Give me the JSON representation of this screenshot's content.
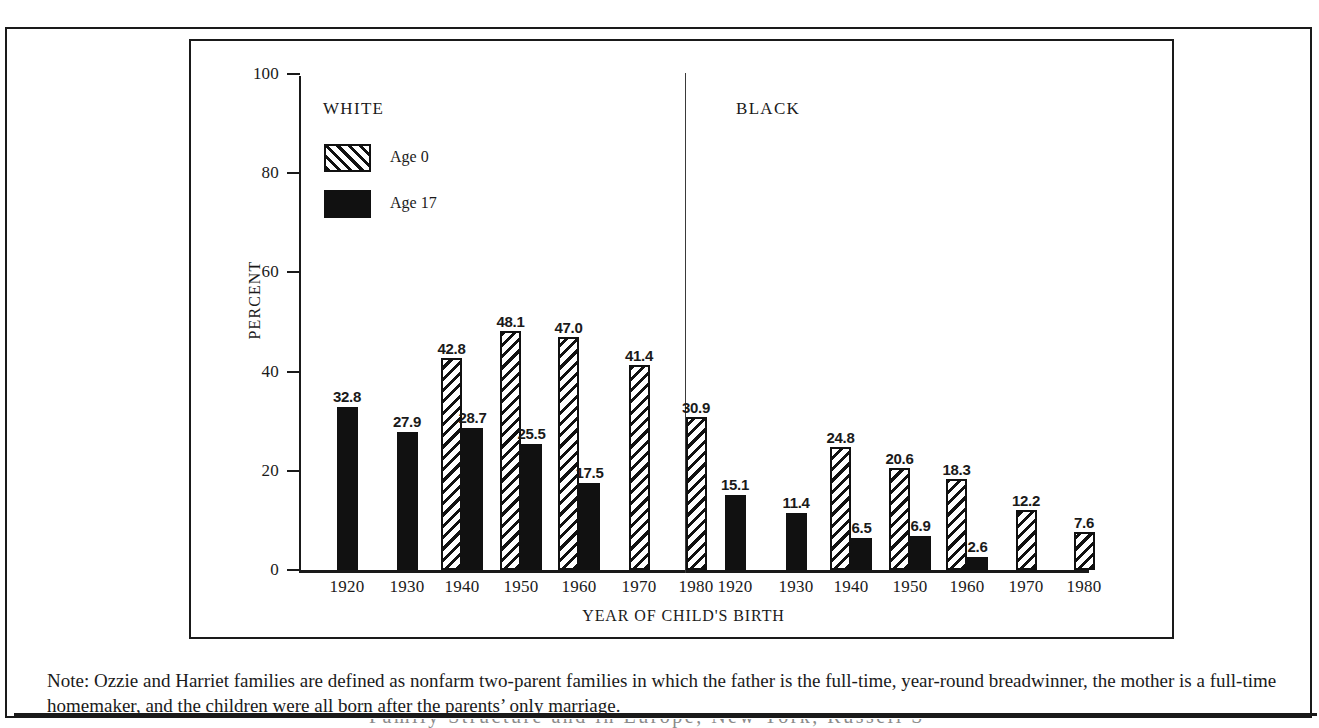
{
  "figure": {
    "y_axis_title": "PERCENT",
    "x_axis_title": "YEAR OF CHILD'S BIRTH",
    "group_white": "WHITE",
    "group_black": "BLACK",
    "legend": [
      {
        "label": "Age 0",
        "swatch": "hatched-swatch"
      },
      {
        "label": "Age 17",
        "swatch": "solid-swatch"
      }
    ],
    "y_ticks": [
      "0",
      "20",
      "40",
      "60",
      "80",
      "100"
    ]
  },
  "note": {
    "text": "Note: Ozzie and Harriet families are defined as nonfarm two-parent families in which the father is the full-time, year-round breadwinner, the mother is a full-time homemaker, and the children were all born after the parents’ only marriage."
  },
  "footer": {
    "clipped_text": "Family Structure and in Europe, New York, Russell S"
  },
  "chart_data": {
    "type": "bar",
    "title": "",
    "xlabel": "YEAR OF CHILD'S BIRTH",
    "ylabel": "PERCENT",
    "ylim": [
      0,
      100
    ],
    "ytick_step": 20,
    "grid": false,
    "legend_position": "inside-top-left",
    "panels": [
      {
        "name": "WHITE",
        "categories": [
          "1920",
          "1930",
          "1940",
          "1950",
          "1960",
          "1970",
          "1980"
        ],
        "series": [
          {
            "name": "Age 0",
            "values": [
              null,
              null,
              42.8,
              48.1,
              47.0,
              41.4,
              30.9
            ]
          },
          {
            "name": "Age 17",
            "values": [
              32.8,
              27.9,
              28.7,
              25.5,
              17.5,
              null,
              null
            ]
          }
        ]
      },
      {
        "name": "BLACK",
        "categories": [
          "1920",
          "1930",
          "1940",
          "1950",
          "1960",
          "1970",
          "1980"
        ],
        "series": [
          {
            "name": "Age 0",
            "values": [
              null,
              null,
              24.8,
              20.6,
              18.3,
              12.2,
              7.6
            ]
          },
          {
            "name": "Age 17",
            "values": [
              15.1,
              11.4,
              6.5,
              6.9,
              2.6,
              null,
              null
            ]
          }
        ]
      }
    ]
  }
}
